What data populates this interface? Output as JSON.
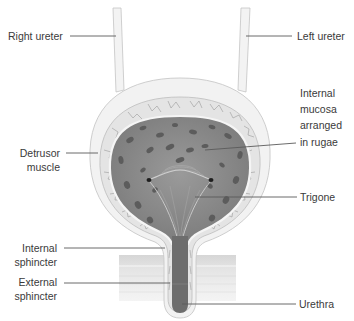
{
  "figure": {
    "labels": {
      "right_ureter": [
        "Right ureter"
      ],
      "left_ureter": [
        "Left ureter"
      ],
      "detrusor": [
        "Detrusor",
        "muscle"
      ],
      "mucosa": [
        "Internal",
        "mucosa",
        "arranged",
        "in rugae"
      ],
      "trigone": [
        "Trigone"
      ],
      "internal_sphincter": [
        "Internal",
        "sphincter"
      ],
      "external_sphincter": [
        "External",
        "sphincter"
      ],
      "urethra": [
        "Urethra"
      ]
    },
    "colors": {
      "background": "#ffffff",
      "outer_wall": "#f1f1f1",
      "muscle_layer": "#e2e2e2",
      "muscle_lines": "#9a9a9a",
      "cavity": "#8a8a8a",
      "rugae_spots": "#5e5e5e",
      "urethra_lumen": "#6e6e6e",
      "external_bands": "#dcdcdc",
      "text": "#3a3a3a",
      "leader": "#5a5a5a"
    }
  }
}
